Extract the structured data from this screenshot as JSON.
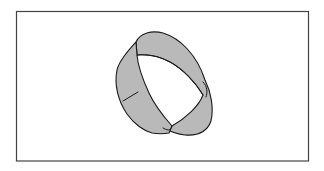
{
  "figure": {
    "colors": {
      "background": "#ffffff",
      "frame": "#444444",
      "band_fill": "#b9b9b9",
      "outline": "#1a1a1a"
    }
  }
}
